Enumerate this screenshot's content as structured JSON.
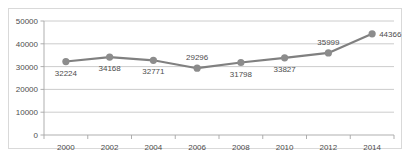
{
  "chart_data": {
    "type": "line",
    "title": "",
    "subtitle": "",
    "xlabel": "",
    "ylabel": "",
    "categories": [
      "2000",
      "2002",
      "2004",
      "2006",
      "2008",
      "2010",
      "2012",
      "2014"
    ],
    "values": [
      32224,
      34168,
      32771,
      29296,
      31798,
      33827,
      35999,
      44366
    ],
    "series": [
      {
        "name": "",
        "values": [
          32224,
          34168,
          32771,
          29296,
          31798,
          33827,
          35999,
          44366
        ]
      }
    ],
    "data_labels": [
      "32224",
      "34168",
      "32771",
      "29296",
      "31798",
      "33827",
      "35999",
      "44366"
    ],
    "data_label_positions": [
      "below",
      "below",
      "below",
      "above",
      "below",
      "below",
      "above",
      "right"
    ],
    "ylim": [
      0,
      50000
    ],
    "y_ticks": [
      0,
      10000,
      20000,
      30000,
      40000,
      50000
    ],
    "y_tick_labels": [
      "0",
      "10000",
      "20000",
      "30000",
      "40000",
      "50000"
    ],
    "x_tick_labels": [
      "2000",
      "2002",
      "2004",
      "2006",
      "2008",
      "2010",
      "2012",
      "2014"
    ],
    "grid": true,
    "legend": "none",
    "colors": {
      "line": "#808080",
      "marker": "#8c8c8c",
      "gridline": "#bfbfbf",
      "axis": "#a6a6a6",
      "text": "#4d4d4d",
      "frame_border": "#d9d9d9",
      "background": "#ffffff"
    }
  }
}
